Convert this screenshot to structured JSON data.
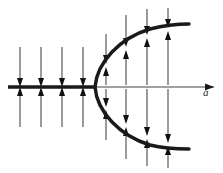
{
  "figure": {
    "title": "Saddle-node bifurcation phase portrait",
    "axis": {
      "label": "a",
      "label_x": 203,
      "label_y": 96,
      "y": 87,
      "x_start": 8,
      "x_end": 214,
      "arrowhead_x": 214,
      "bold_segment_end": 95,
      "bold_color": "#1a1a1a",
      "thin_color": "#808080",
      "bold_width": 3.4,
      "thin_width": 1.4
    },
    "curve": {
      "name": "parabola",
      "color": "#1a1a1a",
      "width": 3.4,
      "vertex_x": 95,
      "vertex_y": 87,
      "upper_end_x": 189,
      "upper_end_y": 24,
      "lower_end_x": 189,
      "lower_end_y": 149,
      "upper_path": "M 95 87 C 97 62 120 38 150 29 C 166 25 180 24 189 24",
      "lower_path": "M 95 87 C 97 112 120 136 150 145 C 166 149 180 149 189 149"
    },
    "arrow_style": {
      "shaft_color": "#7a7a7a",
      "head_color": "#111111",
      "shaft_width": 1.5,
      "head_width": 6,
      "head_length": 9
    },
    "left_region": {
      "description": "Arrows converge onto the stable axis from above and below",
      "columns_x": [
        20,
        41,
        62,
        83
      ],
      "top_start_y": 47,
      "bottom_start_y": 127,
      "converge_y": 87
    },
    "right_region": {
      "description": "Arrows converge onto the two parabola branches",
      "columns": [
        {
          "x": 106,
          "upper_branch_y": 64,
          "lower_branch_y": 110,
          "outer_top_y": 34,
          "outer_bottom_y": 140
        },
        {
          "x": 126,
          "upper_branch_y": 47,
          "lower_branch_y": 127,
          "outer_top_y": 15,
          "outer_bottom_y": 159
        },
        {
          "x": 147,
          "upper_branch_y": 35,
          "lower_branch_y": 139,
          "outer_top_y": 9,
          "outer_bottom_y": 166
        },
        {
          "x": 168,
          "upper_branch_y": 28,
          "lower_branch_y": 146,
          "outer_top_y": 8,
          "outer_bottom_y": 168
        }
      ]
    }
  }
}
